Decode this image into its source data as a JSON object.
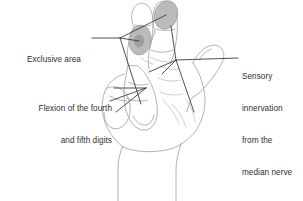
{
  "figure": {
    "background_color": "#ffffff",
    "outline_color": "#a9a9a9",
    "shading_color": "#b5b5b5",
    "shading_core_color": "#9a9a9a",
    "leader_color": "#333333",
    "text_color": "#2f2f2f"
  },
  "annotations": {
    "exclusive_area": {
      "id": "exclusive-area",
      "lines": [
        "Exclusive area"
      ],
      "align": "left"
    },
    "flexion": {
      "id": "flexion-fourth-fifth-digits",
      "lines": [
        "Flexion of the fourth",
        "and fifth digits"
      ],
      "align": "right"
    },
    "sensory": {
      "id": "sensory-innervation-median-nerve",
      "lines": [
        "Sensory",
        "innervation",
        "from the",
        "median nerve"
      ],
      "align": "left"
    }
  },
  "shaded_regions": [
    {
      "name": "index-fingertip-exclusive-area",
      "label": "Exclusive area"
    },
    {
      "name": "thumb-pad-exclusive-area",
      "label": "Exclusive area"
    }
  ]
}
